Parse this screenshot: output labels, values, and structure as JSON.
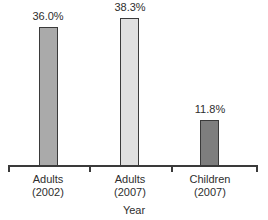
{
  "chart_data": {
    "type": "bar",
    "title": "",
    "xlabel": "Year",
    "ylabel": "",
    "categories": [
      "Adults (2002)",
      "Adults (2007)",
      "Children (2007)"
    ],
    "values": [
      36.0,
      38.3,
      11.8
    ],
    "ylim": [
      0,
      43
    ],
    "grid": false,
    "legend": null,
    "bars": [
      {
        "label_line1": "Adults",
        "label_line2": "(2002)",
        "value": 36.0,
        "value_label": "36.0%",
        "fill": "#aaaaaa"
      },
      {
        "label_line1": "Adults",
        "label_line2": "(2007)",
        "value": 38.3,
        "value_label": "38.3%",
        "fill": "#e0e0e0"
      },
      {
        "label_line1": "Children",
        "label_line2": "(2007)",
        "value": 11.8,
        "value_label": "11.8%",
        "fill": "#7e7e7e"
      }
    ],
    "colors": {
      "bar_border": "#3a3a3a",
      "axis": "#3a3a3a",
      "text": "#2e2e2e",
      "background": "#ffffff"
    }
  }
}
